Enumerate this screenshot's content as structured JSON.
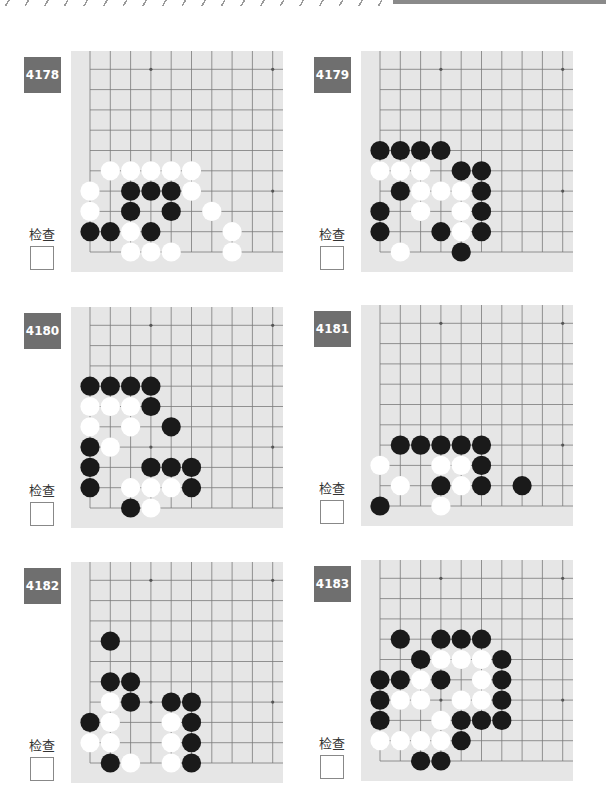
{
  "header": {
    "decoration": "diagonal-slash-stripe",
    "bar_color": "#8a8a8a"
  },
  "check_label": "检查",
  "colors": {
    "badge": "#6f6f6f",
    "board": "#e6e6e6",
    "grid": "#7a7a7a",
    "black": "#1a1a1a",
    "white": "#ffffff"
  },
  "problems": [
    {
      "number": "4178",
      "check_label": "检查",
      "black": [
        [
          0,
          1
        ],
        [
          1,
          1
        ],
        [
          3,
          1
        ],
        [
          2,
          2
        ],
        [
          4,
          2
        ],
        [
          2,
          3
        ],
        [
          3,
          3
        ],
        [
          4,
          3
        ]
      ],
      "white": [
        [
          2,
          0
        ],
        [
          3,
          0
        ],
        [
          4,
          0
        ],
        [
          7,
          0
        ],
        [
          2,
          1
        ],
        [
          7,
          1
        ],
        [
          0,
          2
        ],
        [
          6,
          2
        ],
        [
          0,
          3
        ],
        [
          5,
          3
        ],
        [
          1,
          4
        ],
        [
          2,
          4
        ],
        [
          3,
          4
        ],
        [
          4,
          4
        ],
        [
          5,
          4
        ]
      ]
    },
    {
      "number": "4179",
      "check_label": "检查",
      "black": [
        [
          4,
          0
        ],
        [
          0,
          1
        ],
        [
          3,
          1
        ],
        [
          5,
          1
        ],
        [
          0,
          2
        ],
        [
          5,
          2
        ],
        [
          1,
          3
        ],
        [
          5,
          3
        ],
        [
          4,
          4
        ],
        [
          5,
          4
        ],
        [
          0,
          5
        ],
        [
          1,
          5
        ],
        [
          2,
          5
        ],
        [
          3,
          5
        ]
      ],
      "white": [
        [
          1,
          0
        ],
        [
          4,
          1
        ],
        [
          2,
          2
        ],
        [
          4,
          2
        ],
        [
          2,
          3
        ],
        [
          3,
          3
        ],
        [
          4,
          3
        ],
        [
          0,
          4
        ],
        [
          1,
          4
        ],
        [
          2,
          4
        ]
      ]
    },
    {
      "number": "4180",
      "check_label": "检查",
      "black": [
        [
          2,
          0
        ],
        [
          0,
          1
        ],
        [
          5,
          1
        ],
        [
          0,
          2
        ],
        [
          3,
          2
        ],
        [
          4,
          2
        ],
        [
          5,
          2
        ],
        [
          0,
          3
        ],
        [
          4,
          4
        ],
        [
          3,
          5
        ],
        [
          0,
          6
        ],
        [
          1,
          6
        ],
        [
          2,
          6
        ],
        [
          3,
          6
        ]
      ],
      "white": [
        [
          3,
          0
        ],
        [
          2,
          1
        ],
        [
          3,
          1
        ],
        [
          4,
          1
        ],
        [
          1,
          3
        ],
        [
          0,
          4
        ],
        [
          2,
          4
        ],
        [
          0,
          5
        ],
        [
          1,
          5
        ],
        [
          2,
          5
        ]
      ]
    },
    {
      "number": "4181",
      "check_label": "检查",
      "black": [
        [
          0,
          0
        ],
        [
          3,
          1
        ],
        [
          5,
          1
        ],
        [
          7,
          1
        ],
        [
          5,
          2
        ],
        [
          1,
          3
        ],
        [
          2,
          3
        ],
        [
          3,
          3
        ],
        [
          4,
          3
        ],
        [
          5,
          3
        ]
      ],
      "white": [
        [
          3,
          0
        ],
        [
          1,
          1
        ],
        [
          4,
          1
        ],
        [
          0,
          2
        ],
        [
          3,
          2
        ],
        [
          4,
          2
        ]
      ]
    },
    {
      "number": "4182",
      "check_label": "检查",
      "black": [
        [
          1,
          0
        ],
        [
          5,
          0
        ],
        [
          5,
          1
        ],
        [
          0,
          2
        ],
        [
          5,
          2
        ],
        [
          2,
          3
        ],
        [
          4,
          3
        ],
        [
          5,
          3
        ],
        [
          1,
          4
        ],
        [
          2,
          4
        ],
        [
          1,
          6
        ]
      ],
      "white": [
        [
          2,
          0
        ],
        [
          4,
          0
        ],
        [
          0,
          1
        ],
        [
          1,
          1
        ],
        [
          4,
          1
        ],
        [
          1,
          2
        ],
        [
          4,
          2
        ],
        [
          1,
          3
        ]
      ]
    },
    {
      "number": "4183",
      "check_label": "检查",
      "black": [
        [
          2,
          0
        ],
        [
          3,
          0
        ],
        [
          4,
          1
        ],
        [
          0,
          2
        ],
        [
          4,
          2
        ],
        [
          5,
          2
        ],
        [
          6,
          2
        ],
        [
          0,
          3
        ],
        [
          6,
          3
        ],
        [
          0,
          4
        ],
        [
          1,
          4
        ],
        [
          3,
          4
        ],
        [
          6,
          4
        ],
        [
          2,
          5
        ],
        [
          6,
          5
        ],
        [
          1,
          6
        ],
        [
          3,
          6
        ],
        [
          4,
          6
        ],
        [
          5,
          6
        ]
      ],
      "white": [
        [
          0,
          1
        ],
        [
          1,
          1
        ],
        [
          2,
          1
        ],
        [
          3,
          1
        ],
        [
          3,
          2
        ],
        [
          1,
          3
        ],
        [
          2,
          3
        ],
        [
          4,
          3
        ],
        [
          5,
          3
        ],
        [
          2,
          4
        ],
        [
          5,
          4
        ],
        [
          3,
          5
        ],
        [
          4,
          5
        ],
        [
          5,
          5
        ]
      ]
    }
  ]
}
